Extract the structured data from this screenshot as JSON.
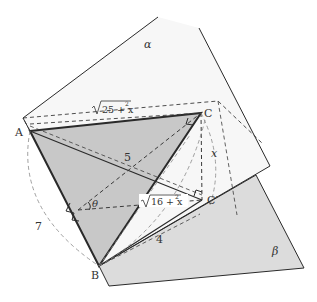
{
  "diagram": {
    "type": "3d-geometry-two-planes",
    "planes": [
      {
        "name": "alpha",
        "label": "α"
      },
      {
        "name": "beta",
        "label": "β"
      }
    ],
    "points": {
      "A": {
        "label": "A"
      },
      "B": {
        "label": "B"
      },
      "C": {
        "label": "C"
      },
      "C_prime": {
        "label": "C′"
      }
    },
    "edge_labels": {
      "AC": "√(25 + x²)",
      "AB": "7",
      "AC_prime": "5",
      "CC_prime": "x",
      "BC_prime": "4",
      "foot_to_C_prime": "√(16 + x²)",
      "angle": "θ"
    },
    "text": {
      "sqrt25_main": "25 + x",
      "sqrt25_sup": "2",
      "sqrt16_main": "16 + x",
      "sqrt16_sup": "2",
      "seven": "7",
      "five": "5",
      "four": "4",
      "x": "x",
      "theta": "θ",
      "alpha": "α",
      "beta": "β",
      "A": "A",
      "B": "B",
      "C": "C",
      "Cp": "C′"
    },
    "colors": {
      "line": "#2a2a2a",
      "triangle_fill": "#c8c8c8",
      "beta_fill": "#dcdcdc",
      "alpha_fill": "#f6f6f6",
      "dashed": "#3a3a3a",
      "arc": "#888888"
    }
  }
}
